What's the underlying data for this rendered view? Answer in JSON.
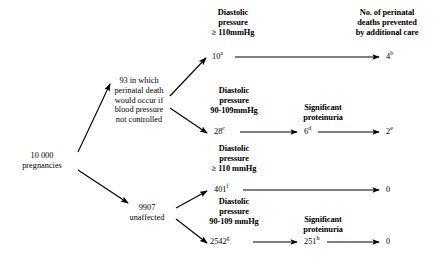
{
  "figure": {
    "type": "flowchart-decision-tree",
    "topic": "Perinatal outcome by diastolic blood pressure and proteinuria"
  },
  "root": {
    "label": "10 000\npregnancies"
  },
  "branches": [
    {
      "id": "affected",
      "label": "93 in which\nperinatal death\nwould occur if\nblood pressure\nnot controlled"
    },
    {
      "id": "unaffected",
      "label": "9907\nunaffected"
    }
  ],
  "column_headers": {
    "outcome": "No. of perinatal\ndeaths prevented\nby additional care",
    "proteinuria": "Significant\nproteinuria"
  },
  "rows": [
    {
      "id": "row-a",
      "from": "affected",
      "condition": "Diastolic\npressure\n≥ 110mmHg",
      "value": "10",
      "value_note": "a",
      "has_proteinuria_stage": false,
      "outcome": "4",
      "outcome_note": "b"
    },
    {
      "id": "row-b",
      "from": "affected",
      "condition": "Diastolic\npressure\n90-109mmHg",
      "value": "28",
      "value_note": "c",
      "has_proteinuria_stage": true,
      "proteinuria_value": "6",
      "proteinuria_note": "d",
      "outcome": "2",
      "outcome_note": "e"
    },
    {
      "id": "row-c",
      "from": "unaffected",
      "condition": "Diastolic\npressure\n≥ 110 mmHg",
      "value": "401",
      "value_note": "f",
      "has_proteinuria_stage": false,
      "outcome": "0",
      "outcome_note": ""
    },
    {
      "id": "row-d",
      "from": "unaffected",
      "condition": "Diastolic\npressure\n90-109 mmHg",
      "value": "2542",
      "value_note": "g",
      "has_proteinuria_stage": true,
      "proteinuria_value": "251",
      "proteinuria_note": "h",
      "outcome": "0",
      "outcome_note": ""
    }
  ],
  "colors": {
    "ink": "#000000",
    "background": "#ffffff"
  }
}
